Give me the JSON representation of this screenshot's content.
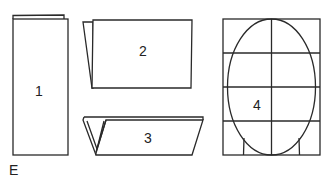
{
  "figure": {
    "label": "E",
    "panels": [
      {
        "id": 1,
        "label": "1",
        "description": "tall vertically folded sheet"
      },
      {
        "id": 2,
        "label": "2",
        "description": "horizontal sheet folded with back flap"
      },
      {
        "id": 3,
        "label": "3",
        "description": "sheet folded into V-shaped pleat"
      },
      {
        "id": 4,
        "label": "4",
        "description": "head oval drawn on 2x4 grid with neck lines"
      }
    ]
  },
  "colors": {
    "line": "#2a2a2a",
    "background": "#ffffff"
  }
}
